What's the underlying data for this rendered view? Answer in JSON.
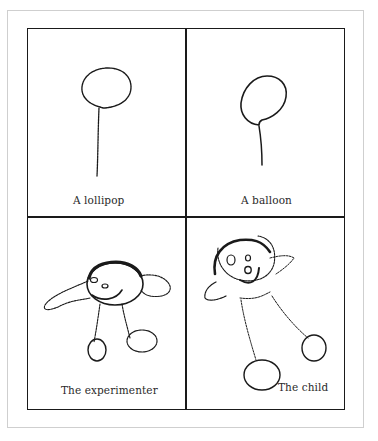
{
  "figure": {
    "panels": [
      {
        "id": "lollipop",
        "caption": "A lollipop",
        "subject": "lollipop-drawing"
      },
      {
        "id": "balloon",
        "caption": "A balloon",
        "subject": "balloon-drawing"
      },
      {
        "id": "experimenter",
        "caption": "The experimenter",
        "subject": "human-figure-drawing"
      },
      {
        "id": "child",
        "caption": "The child",
        "subject": "human-figure-drawing"
      }
    ],
    "layout": {
      "rows": 2,
      "columns": 2
    },
    "colors": {
      "ink": "#1a1a1a",
      "frame": "#cfcfcf",
      "background": "#ffffff"
    }
  }
}
